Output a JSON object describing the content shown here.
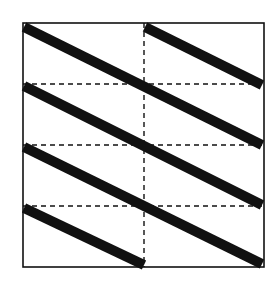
{
  "diagram": {
    "width": 277,
    "height": 292,
    "background": "#ffffff",
    "ink_color": "#111111",
    "frame": {
      "x": 23,
      "y": 23,
      "width": 241,
      "height": 244,
      "stroke_width": 1.6
    },
    "grid": {
      "style": "dashed",
      "stroke_width": 1.4,
      "dash": "5,4",
      "vertical_x": [
        144
      ],
      "horizontal_y": [
        84,
        145,
        206
      ]
    },
    "stripes": {
      "count": 5,
      "stroke_width": 10,
      "segments": [
        {
          "x1": 145,
          "y1": 27,
          "x2": 262,
          "y2": 85
        },
        {
          "x1": 24,
          "y1": 27,
          "x2": 262,
          "y2": 145
        },
        {
          "x1": 24,
          "y1": 86,
          "x2": 262,
          "y2": 205
        },
        {
          "x1": 24,
          "y1": 147,
          "x2": 262,
          "y2": 264
        },
        {
          "x1": 24,
          "y1": 208,
          "x2": 144,
          "y2": 265
        }
      ]
    }
  }
}
